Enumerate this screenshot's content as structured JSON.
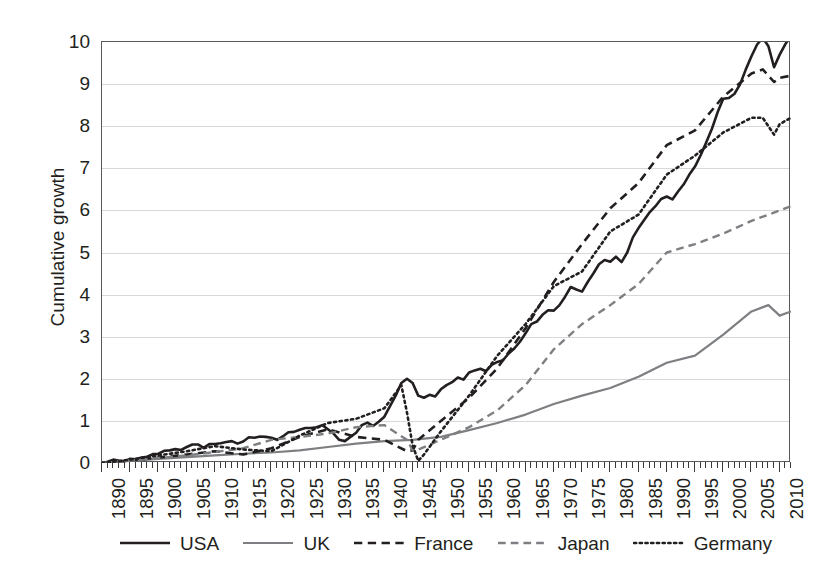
{
  "chart_data": {
    "type": "line",
    "title": "",
    "xlabel": "",
    "ylabel": "Cumulative growth",
    "xlim": [
      1890,
      2012
    ],
    "ylim": [
      0,
      10
    ],
    "grid": true,
    "legend_position": "bottom",
    "y_ticks": [
      0,
      1,
      2,
      3,
      4,
      5,
      6,
      7,
      8,
      9,
      10
    ],
    "x_ticks": [
      1890,
      1895,
      1900,
      1905,
      1910,
      1915,
      1920,
      1925,
      1930,
      1935,
      1940,
      1945,
      1950,
      1955,
      1960,
      1965,
      1970,
      1975,
      1980,
      1985,
      1990,
      1995,
      2000,
      2005,
      2010
    ],
    "x_tick_labels": [
      "1890",
      "1895",
      "1900",
      "1905",
      "1910",
      "1915",
      "1920",
      "1925",
      "1930",
      "1935",
      "1940",
      "1945",
      "1950",
      "1955",
      "1960",
      "1965",
      "1970",
      "1975",
      "1980",
      "1985",
      "1990",
      "1995",
      "2000",
      "2005",
      "2010"
    ],
    "x_minor_step": 1,
    "series": [
      {
        "name": "USA",
        "color": "#231f20",
        "style": "solid",
        "width": 2.6,
        "x": [
          1890,
          1891,
          1892,
          1893,
          1894,
          1895,
          1896,
          1897,
          1898,
          1899,
          1900,
          1901,
          1902,
          1903,
          1904,
          1905,
          1906,
          1907,
          1908,
          1909,
          1910,
          1911,
          1912,
          1913,
          1914,
          1915,
          1916,
          1917,
          1918,
          1919,
          1920,
          1921,
          1922,
          1923,
          1924,
          1925,
          1926,
          1927,
          1928,
          1929,
          1930,
          1931,
          1932,
          1933,
          1934,
          1935,
          1936,
          1937,
          1938,
          1939,
          1940,
          1941,
          1942,
          1943,
          1944,
          1945,
          1946,
          1947,
          1948,
          1949,
          1950,
          1951,
          1952,
          1953,
          1954,
          1955,
          1956,
          1957,
          1958,
          1959,
          1960,
          1961,
          1962,
          1963,
          1964,
          1965,
          1966,
          1967,
          1968,
          1969,
          1970,
          1971,
          1972,
          1973,
          1974,
          1975,
          1976,
          1977,
          1978,
          1979,
          1980,
          1981,
          1982,
          1983,
          1984,
          1985,
          1986,
          1987,
          1988,
          1989,
          1990,
          1991,
          1992,
          1993,
          1994,
          1995,
          1996,
          1997,
          1998,
          1999,
          2000,
          2001,
          2002,
          2003,
          2004,
          2005,
          2006,
          2007,
          2008,
          2009,
          2010,
          2011,
          2012
        ],
        "y": [
          0.0,
          0.03,
          0.08,
          0.05,
          0.04,
          0.1,
          0.09,
          0.13,
          0.15,
          0.21,
          0.22,
          0.29,
          0.3,
          0.33,
          0.31,
          0.38,
          0.44,
          0.44,
          0.36,
          0.45,
          0.45,
          0.47,
          0.5,
          0.52,
          0.46,
          0.51,
          0.61,
          0.6,
          0.63,
          0.62,
          0.6,
          0.55,
          0.63,
          0.73,
          0.74,
          0.79,
          0.83,
          0.83,
          0.85,
          0.9,
          0.8,
          0.7,
          0.55,
          0.52,
          0.62,
          0.72,
          0.9,
          0.96,
          0.88,
          0.98,
          1.1,
          1.35,
          1.6,
          1.9,
          2.0,
          1.9,
          1.6,
          1.55,
          1.62,
          1.58,
          1.75,
          1.85,
          1.92,
          2.03,
          1.98,
          2.15,
          2.2,
          2.24,
          2.18,
          2.33,
          2.4,
          2.44,
          2.6,
          2.72,
          2.88,
          3.08,
          3.3,
          3.36,
          3.52,
          3.63,
          3.62,
          3.75,
          3.95,
          4.18,
          4.12,
          4.07,
          4.3,
          4.5,
          4.72,
          4.82,
          4.78,
          4.9,
          4.77,
          5.0,
          5.36,
          5.58,
          5.77,
          5.96,
          6.1,
          6.27,
          6.33,
          6.26,
          6.45,
          6.62,
          6.85,
          7.04,
          7.31,
          7.62,
          7.94,
          8.33,
          8.65,
          8.67,
          8.77,
          9.0,
          9.35,
          9.66,
          9.94,
          10.1,
          9.9,
          9.4,
          9.7,
          9.95,
          10.15
        ]
      },
      {
        "name": "UK",
        "color": "#7d7f82",
        "style": "solid",
        "width": 2.2,
        "x": [
          1890,
          1895,
          1900,
          1905,
          1910,
          1915,
          1920,
          1925,
          1930,
          1935,
          1940,
          1945,
          1950,
          1955,
          1960,
          1965,
          1970,
          1975,
          1980,
          1985,
          1990,
          1995,
          2000,
          2005,
          2008,
          2010,
          2012
        ],
        "y": [
          0.0,
          0.05,
          0.1,
          0.14,
          0.18,
          0.22,
          0.25,
          0.3,
          0.38,
          0.46,
          0.52,
          0.55,
          0.62,
          0.78,
          0.95,
          1.15,
          1.4,
          1.6,
          1.78,
          2.05,
          2.38,
          2.55,
          3.05,
          3.6,
          3.75,
          3.5,
          3.6
        ]
      },
      {
        "name": "France",
        "color": "#231f20",
        "style": "dashed",
        "width": 2.6,
        "x": [
          1890,
          1895,
          1900,
          1905,
          1910,
          1915,
          1920,
          1925,
          1930,
          1935,
          1940,
          1944,
          1945,
          1946,
          1950,
          1955,
          1960,
          1965,
          1970,
          1975,
          1980,
          1985,
          1990,
          1995,
          2000,
          2005,
          2007,
          2009,
          2010,
          2012
        ],
        "y": [
          0.0,
          0.06,
          0.13,
          0.2,
          0.28,
          0.2,
          0.35,
          0.62,
          0.8,
          0.62,
          0.55,
          0.28,
          0.3,
          0.55,
          1.0,
          1.55,
          2.25,
          3.2,
          4.3,
          5.2,
          6.05,
          6.65,
          7.55,
          7.9,
          8.7,
          9.25,
          9.35,
          9.05,
          9.15,
          9.2
        ]
      },
      {
        "name": "Japan",
        "color": "#7d7f82",
        "style": "dashed",
        "width": 2.4,
        "x": [
          1890,
          1895,
          1900,
          1905,
          1910,
          1915,
          1920,
          1925,
          1930,
          1935,
          1940,
          1944,
          1945,
          1946,
          1950,
          1955,
          1960,
          1965,
          1970,
          1975,
          1980,
          1985,
          1990,
          1995,
          2000,
          2005,
          2010,
          2012
        ],
        "y": [
          0.0,
          0.06,
          0.12,
          0.18,
          0.26,
          0.35,
          0.55,
          0.62,
          0.7,
          0.85,
          0.9,
          0.55,
          0.3,
          0.32,
          0.55,
          0.85,
          1.25,
          1.85,
          2.7,
          3.3,
          3.75,
          4.25,
          5.0,
          5.2,
          5.45,
          5.75,
          6.0,
          6.1
        ]
      },
      {
        "name": "Germany",
        "color": "#231f20",
        "style": "dotted",
        "width": 2.6,
        "x": [
          1890,
          1895,
          1900,
          1905,
          1910,
          1915,
          1920,
          1925,
          1930,
          1935,
          1940,
          1943,
          1944,
          1945,
          1946,
          1947,
          1950,
          1955,
          1960,
          1965,
          1970,
          1975,
          1980,
          1985,
          1990,
          1995,
          2000,
          2005,
          2007,
          2009,
          2010,
          2012
        ],
        "y": [
          0.0,
          0.08,
          0.18,
          0.28,
          0.4,
          0.32,
          0.28,
          0.65,
          0.95,
          1.05,
          1.3,
          1.85,
          1.2,
          0.42,
          0.05,
          0.2,
          0.75,
          1.6,
          2.55,
          3.3,
          4.2,
          4.55,
          5.5,
          5.9,
          6.85,
          7.3,
          7.85,
          8.2,
          8.2,
          7.8,
          8.05,
          8.2
        ]
      }
    ]
  },
  "axis": {
    "y_title": "Cumulative growth"
  },
  "legend": {
    "items": [
      {
        "label": "USA",
        "icon": "solid-line-swatch"
      },
      {
        "label": "UK",
        "icon": "solid-line-swatch"
      },
      {
        "label": "France",
        "icon": "dashed-line-swatch"
      },
      {
        "label": "Japan",
        "icon": "dashed-line-swatch"
      },
      {
        "label": "Germany",
        "icon": "dotted-line-swatch"
      }
    ]
  }
}
